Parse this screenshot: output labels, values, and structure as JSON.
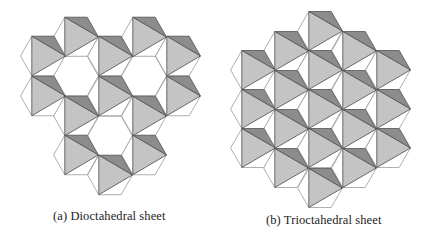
{
  "figure": {
    "panels": [
      {
        "id": "a",
        "caption": "(a) Dioctahedral sheet",
        "type": "dioctahedral",
        "hex_radius": 22.4,
        "hex_height": 39.5,
        "octahedra": [
          {
            "cx": 43,
            "cy": 56,
            "filled": true
          },
          {
            "cx": 43,
            "cy": 96,
            "filled": true
          },
          {
            "cx": 76,
            "cy": 37,
            "filled": true
          },
          {
            "cx": 76,
            "cy": 76,
            "filled": false
          },
          {
            "cx": 76,
            "cy": 116,
            "filled": true
          },
          {
            "cx": 76,
            "cy": 155,
            "filled": true
          },
          {
            "cx": 110,
            "cy": 56,
            "filled": true
          },
          {
            "cx": 110,
            "cy": 96,
            "filled": true
          },
          {
            "cx": 110,
            "cy": 136,
            "filled": false
          },
          {
            "cx": 110,
            "cy": 175,
            "filled": true
          },
          {
            "cx": 144,
            "cy": 37,
            "filled": true
          },
          {
            "cx": 144,
            "cy": 76,
            "filled": false
          },
          {
            "cx": 144,
            "cy": 116,
            "filled": true
          },
          {
            "cx": 144,
            "cy": 155,
            "filled": true
          },
          {
            "cx": 178,
            "cy": 56,
            "filled": true
          },
          {
            "cx": 178,
            "cy": 96,
            "filled": true
          }
        ]
      },
      {
        "id": "b",
        "caption": "(b) Trioctahedral sheet",
        "type": "trioctahedral",
        "hex_radius": 22.4,
        "hex_height": 39,
        "octahedra": [
          {
            "cx": 253,
            "cy": 70,
            "filled": true
          },
          {
            "cx": 253,
            "cy": 109,
            "filled": true
          },
          {
            "cx": 253,
            "cy": 148,
            "filled": true
          },
          {
            "cx": 286,
            "cy": 51,
            "filled": true
          },
          {
            "cx": 286,
            "cy": 90,
            "filled": true
          },
          {
            "cx": 286,
            "cy": 129,
            "filled": true
          },
          {
            "cx": 286,
            "cy": 168,
            "filled": true
          },
          {
            "cx": 320,
            "cy": 31,
            "filled": true
          },
          {
            "cx": 320,
            "cy": 70,
            "filled": true
          },
          {
            "cx": 320,
            "cy": 109,
            "filled": true
          },
          {
            "cx": 320,
            "cy": 148,
            "filled": true
          },
          {
            "cx": 320,
            "cy": 188,
            "filled": true
          },
          {
            "cx": 354,
            "cy": 51,
            "filled": true
          },
          {
            "cx": 354,
            "cy": 90,
            "filled": true
          },
          {
            "cx": 354,
            "cy": 129,
            "filled": true
          },
          {
            "cx": 354,
            "cy": 168,
            "filled": true
          },
          {
            "cx": 388,
            "cy": 70,
            "filled": true
          },
          {
            "cx": 388,
            "cy": 109,
            "filled": true
          },
          {
            "cx": 388,
            "cy": 148,
            "filled": true
          }
        ]
      }
    ],
    "colors": {
      "background": "#ffffff",
      "hex_outline": "#9a9a9a",
      "light_face": "#c4c4c4",
      "dark_face": "#8c8c8c",
      "face_edge": "#4a4a4a"
    }
  }
}
